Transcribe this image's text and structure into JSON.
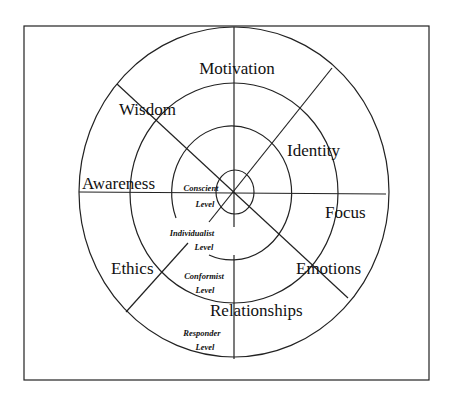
{
  "diagram": {
    "title": "",
    "sectors": [
      {
        "label": "Motivation"
      },
      {
        "label": "Wisdom"
      },
      {
        "label": "Identity"
      },
      {
        "label": "Awareness"
      },
      {
        "label": "Focus"
      },
      {
        "label": "Ethics"
      },
      {
        "label": "Emotions"
      },
      {
        "label": "Relationships"
      }
    ],
    "levels": [
      {
        "name": "Conscient",
        "suffix": "Level"
      },
      {
        "name": "Individualist",
        "suffix": "Level"
      },
      {
        "name": "Conformist",
        "suffix": "Level"
      },
      {
        "name": "Responder",
        "suffix": "Level"
      }
    ],
    "colors": {
      "line": "#222222",
      "text": "#111111",
      "background": "#ffffff"
    }
  }
}
